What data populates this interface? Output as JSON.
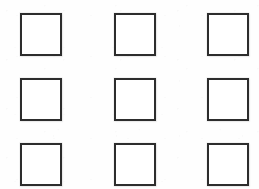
{
  "page": {
    "width": 259,
    "height": 189,
    "background_color": "#fefefe",
    "document_type": "checkbox-grid"
  },
  "grid": {
    "rows": 3,
    "columns": 3,
    "total_cells": 9,
    "column_left_positions": [
      20,
      114,
      207
    ],
    "row_top_positions": [
      13,
      78,
      143
    ],
    "cell_width": 42,
    "cell_height": 43,
    "border_width": 2.5,
    "border_color": "#2d2d2d",
    "fill_color": "#ffffff",
    "cells": [
      {
        "name": "checkbox-r1-c1",
        "row": 1,
        "column": 1,
        "checked": false,
        "label": ""
      },
      {
        "name": "checkbox-r1-c2",
        "row": 1,
        "column": 2,
        "checked": false,
        "label": ""
      },
      {
        "name": "checkbox-r1-c3",
        "row": 1,
        "column": 3,
        "checked": false,
        "label": ""
      },
      {
        "name": "checkbox-r2-c1",
        "row": 2,
        "column": 1,
        "checked": false,
        "label": ""
      },
      {
        "name": "checkbox-r2-c2",
        "row": 2,
        "column": 2,
        "checked": false,
        "label": ""
      },
      {
        "name": "checkbox-r2-c3",
        "row": 2,
        "column": 3,
        "checked": false,
        "label": ""
      },
      {
        "name": "checkbox-r3-c1",
        "row": 3,
        "column": 1,
        "checked": false,
        "label": ""
      },
      {
        "name": "checkbox-r3-c2",
        "row": 3,
        "column": 2,
        "checked": false,
        "label": ""
      },
      {
        "name": "checkbox-r3-c3",
        "row": 3,
        "column": 3,
        "checked": false,
        "label": ""
      }
    ]
  }
}
